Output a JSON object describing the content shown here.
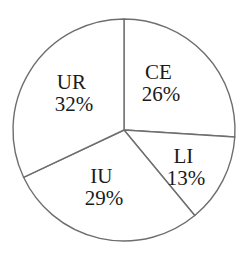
{
  "chart_data": {
    "type": "pie",
    "title": "",
    "categories": [
      "CE",
      "LI",
      "IU",
      "UR"
    ],
    "values": [
      26,
      13,
      29,
      32
    ],
    "unit": "%",
    "labels": [
      "CE\n26%",
      "LI\n13%",
      "IU\n29%",
      "UR\n32%"
    ],
    "start_angle_deg": 90,
    "direction": "clockwise",
    "fill": "#ffffff",
    "stroke": "#6e6e6e",
    "legend": "none",
    "label_position": "inside"
  },
  "slices": [
    {
      "name": "CE",
      "pct": "26%"
    },
    {
      "name": "LI",
      "pct": "13%"
    },
    {
      "name": "IU",
      "pct": "29%"
    },
    {
      "name": "UR",
      "pct": "32%"
    }
  ],
  "caption": ""
}
